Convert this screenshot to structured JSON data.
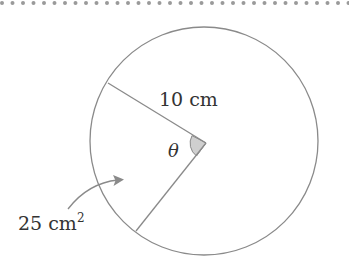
{
  "diagram": {
    "type": "circle-sector",
    "radius_label": "10 cm",
    "angle_label": "θ",
    "area_label_main": "25 cm",
    "area_label_sup": "2",
    "colors": {
      "stroke": "#8a8a8a",
      "angle_fill": "#cfcfcf",
      "text": "#333333",
      "border_dots": "#9a9a9a"
    }
  }
}
